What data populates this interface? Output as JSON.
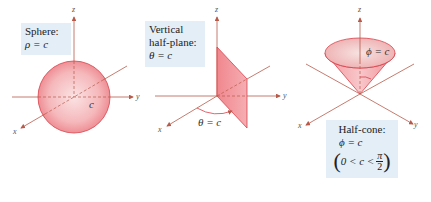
{
  "panels": [
    {
      "id": "sphere",
      "box": {
        "title": "Sphere:",
        "equation": "ρ = c"
      },
      "labels": {
        "radius": "c"
      },
      "axes": {
        "x": "x",
        "y": "y",
        "z": "z"
      }
    },
    {
      "id": "half-plane",
      "box": {
        "title_line1": "Vertical",
        "title_line2": "half-plane:",
        "equation": "θ = c"
      },
      "labels": {
        "angle": "θ = c"
      },
      "axes": {
        "x": "x",
        "y": "y",
        "z": "z"
      }
    },
    {
      "id": "half-cone",
      "box": {
        "title": "Half-cone:",
        "equation": "ϕ = c",
        "constraint_open": "(",
        "constraint_body": "0 < c <",
        "frac_num": "π",
        "frac_den": "2",
        "constraint_close": ")"
      },
      "labels": {
        "angle": "ϕ = c"
      },
      "axes": {
        "x": "x",
        "y": "y",
        "z": "z"
      }
    }
  ],
  "colors": {
    "surface_fill": "#f08a8f",
    "surface_stroke": "#d9404a",
    "axis": "#b85a4a",
    "box_bg": "#e4eef7"
  }
}
